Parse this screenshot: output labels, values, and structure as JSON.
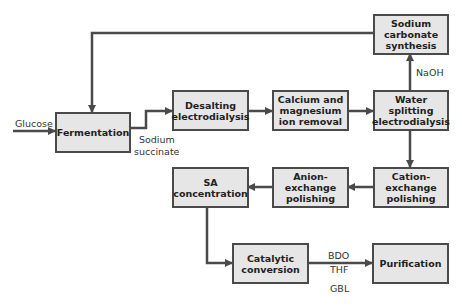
{
  "diagram": {
    "type": "process-flowchart",
    "colors": {
      "box_fill": "#e6e6e6",
      "line": "#4a4a4a",
      "text": "#222222"
    },
    "nodes": [
      {
        "id": "fermentation",
        "label": "Fermentation"
      },
      {
        "id": "desalting",
        "label": "Desalting electrodialysis"
      },
      {
        "id": "ca-mg",
        "label": "Calcium and magnesium ion removal"
      },
      {
        "id": "water-splitting",
        "label": "Water splitting electrodialysis"
      },
      {
        "id": "sodium-carbonate",
        "label": "Sodium carbonate synthesis"
      },
      {
        "id": "cation",
        "label": "Cation-exchange polishing"
      },
      {
        "id": "anion",
        "label": "Anion-exchange polishing"
      },
      {
        "id": "sa-conc",
        "label": "SA concentration"
      },
      {
        "id": "catalytic",
        "label": "Catalytic conversion"
      },
      {
        "id": "purification",
        "label": "Purification"
      }
    ],
    "edge_labels": {
      "glucose": "Glucose",
      "sodium_succinate_1": "Sodium",
      "sodium_succinate_2": "succinate",
      "naoh": "NaOH",
      "bdo": "BDO",
      "thf": "THF",
      "gbl": "GBL"
    },
    "edges": [
      {
        "from": "input",
        "to": "fermentation",
        "label": "Glucose"
      },
      {
        "from": "fermentation",
        "to": "desalting",
        "label": "Sodium succinate"
      },
      {
        "from": "desalting",
        "to": "ca-mg"
      },
      {
        "from": "ca-mg",
        "to": "water-splitting"
      },
      {
        "from": "water-splitting",
        "to": "sodium-carbonate",
        "label": "NaOH"
      },
      {
        "from": "sodium-carbonate",
        "to": "fermentation"
      },
      {
        "from": "water-splitting",
        "to": "cation"
      },
      {
        "from": "cation",
        "to": "anion"
      },
      {
        "from": "anion",
        "to": "sa-conc"
      },
      {
        "from": "sa-conc",
        "to": "catalytic"
      },
      {
        "from": "catalytic",
        "to": "purification",
        "label": "BDO, THF, GBL"
      }
    ]
  }
}
